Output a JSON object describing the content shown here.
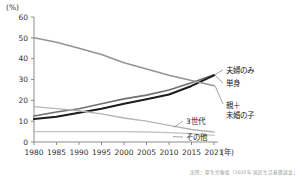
{
  "chart_data": {
    "type": "line",
    "title": "",
    "xlabel": "年",
    "ylabel": "",
    "unit_label": "(%)",
    "grid": false,
    "legend_position": "right-inline-labels",
    "ylim": [
      0,
      60
    ],
    "yticks": [
      0,
      10,
      20,
      30,
      40,
      50,
      60
    ],
    "categories": [
      "1980",
      "1985",
      "1990",
      "1995",
      "2000",
      "2005",
      "2010",
      "2015",
      "2021"
    ],
    "x_axis_suffix": "(年)",
    "series": [
      {
        "name": "夫婦のみ",
        "color": "#6f6f6f",
        "width": 1.6,
        "values": [
          12.5,
          14.4,
          16.0,
          18.4,
          20.7,
          22.5,
          25.0,
          28.4,
          32.3
        ]
      },
      {
        "name": "単身",
        "color": "#1c1c1c",
        "width": 2.0,
        "values": [
          11.0,
          12.1,
          14.0,
          16.0,
          18.4,
          20.5,
          22.8,
          26.9,
          32.0
        ]
      },
      {
        "name": "親＋\n未婚の子",
        "label_line1": "親＋",
        "label_line2": "未婚の子",
        "color": "#949494",
        "width": 1.6,
        "values": [
          50.0,
          47.9,
          45.0,
          42.0,
          38.0,
          35.0,
          32.0,
          29.5,
          27.0
        ]
      },
      {
        "name": "3世代",
        "color": "#b5b5b5",
        "width": 1.4,
        "values": [
          17.0,
          16.0,
          15.0,
          13.5,
          11.5,
          10.0,
          8.0,
          6.0,
          4.8
        ]
      },
      {
        "name": "その他",
        "color": "#c4c4c4",
        "width": 1.4,
        "values": [
          5.0,
          5.0,
          5.0,
          5.0,
          5.0,
          4.8,
          4.5,
          4.0,
          3.2
        ]
      }
    ]
  },
  "source": {
    "text": "出所：厚生労働省「2022年 国民生活基礎調査」"
  }
}
